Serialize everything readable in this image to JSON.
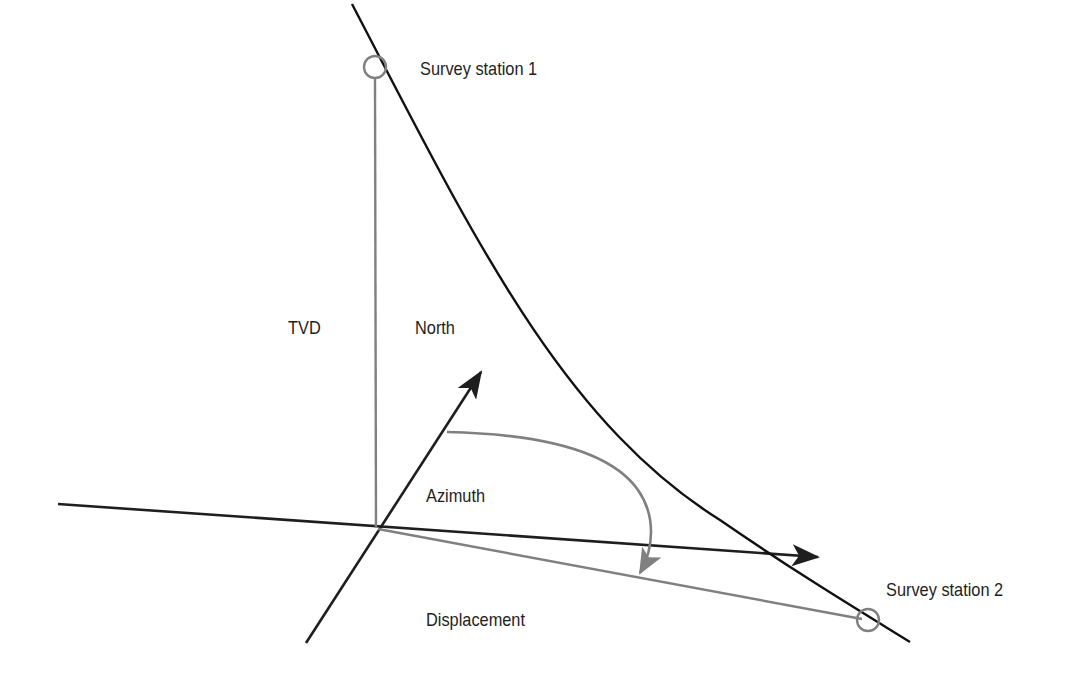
{
  "diagram": {
    "type": "well-survey-geometry",
    "labels": {
      "station1": "Survey station 1",
      "station2": "Survey station 2",
      "tvd": "TVD",
      "north": "North",
      "azimuth": "Azimuth",
      "displacement": "Displacement"
    },
    "colors": {
      "background": "#ffffff",
      "axis_line": "#1e1e1e",
      "wellpath_line": "#111111",
      "construction_line": "#808080",
      "station_marker": "#808080",
      "text": "#1e1e1e"
    },
    "points": {
      "origin": [
        378,
        528
      ],
      "station1": [
        375,
        67
      ],
      "station2": [
        868,
        620
      ]
    }
  }
}
